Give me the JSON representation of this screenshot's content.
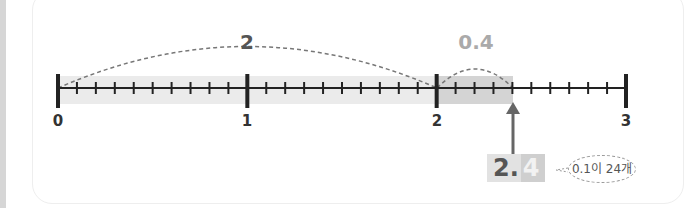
{
  "number_line": {
    "ticks": [
      "0",
      "1",
      "2",
      "3"
    ],
    "minor_divisions": 10,
    "highlight_value": 2.4
  },
  "jumps": [
    {
      "label": "2",
      "from": 0,
      "to": 2,
      "color": "#555555"
    },
    {
      "label": "0.4",
      "from": 2,
      "to": 2.4,
      "color": "#aaaaaa"
    }
  ],
  "answer": {
    "integer_part": "2.",
    "decimal_part": "4"
  },
  "bubble": {
    "text": "0.1이 24개"
  }
}
